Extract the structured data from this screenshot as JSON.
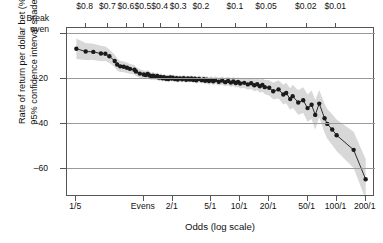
{
  "chart_data": {
    "type": "line",
    "title": "",
    "subtitle": "",
    "xlabel": "Odds (log scale)",
    "ylabel": "Rate of return per dollar bet (%)\n95% confidence interval shaded",
    "ylabel_line1": "Rate of return per dollar bet (%)",
    "ylabel_line2": "95% confidence interval shaded",
    "grid": true,
    "legend_position": "none",
    "annotations": [
      "Break even",
      "95% confidence interval shaded"
    ],
    "y_axis": {
      "ticks": [
        0,
        -20,
        -40,
        -60
      ],
      "tick_labels": [
        "Break even",
        "-20",
        "-40",
        "-60"
      ],
      "break_even_label_line1": "Break",
      "break_even_label_line2": "even",
      "ylim": [
        -72,
        2
      ],
      "unit": "%"
    },
    "x_axis_bottom": {
      "label": "Odds (log scale)",
      "scale": "log",
      "tick_labels": [
        "1/5",
        "Evens",
        "2/1",
        "5/1",
        "10/1",
        "20/1",
        "50/1",
        "100/1",
        "200/1"
      ],
      "tick_values": [
        0.2,
        1,
        2,
        5,
        10,
        20,
        50,
        100,
        200
      ],
      "xlim": [
        0.16,
        250
      ]
    },
    "x_axis_top": {
      "label": "",
      "tick_labels": [
        "$0.8",
        "$0.7",
        "$0.6",
        "$0.5",
        "$0.4",
        "$0.3",
        "$0.2",
        "$0.1",
        "$0.05",
        "$0.02",
        "$0.01"
      ],
      "tick_values": [
        0.8,
        0.7,
        0.6,
        0.5,
        0.4,
        0.3,
        0.2,
        0.1,
        0.05,
        0.02,
        0.01
      ],
      "description": "implied probability price per dollar"
    },
    "series": [
      {
        "name": "Rate of return per dollar bet",
        "marker": "filled-circle",
        "line_color": "#1a1a1a",
        "band_color": "#c9c9c9",
        "x": [
          0.2,
          0.25,
          0.3,
          0.36,
          0.4,
          0.44,
          0.5,
          0.53,
          0.57,
          0.62,
          0.67,
          0.72,
          0.8,
          0.83,
          0.91,
          1.0,
          1.05,
          1.1,
          1.15,
          1.2,
          1.25,
          1.3,
          1.38,
          1.44,
          1.5,
          1.57,
          1.62,
          1.7,
          1.75,
          1.8,
          1.88,
          1.95,
          2.0,
          2.1,
          2.2,
          2.25,
          2.38,
          2.5,
          2.6,
          2.75,
          2.87,
          3.0,
          3.13,
          3.25,
          3.4,
          3.5,
          3.75,
          4.0,
          4.2,
          4.33,
          4.5,
          4.75,
          5.0,
          5.25,
          5.5,
          6.0,
          6.5,
          7.0,
          7.5,
          8.0,
          8.5,
          9.0,
          9.5,
          10.0,
          11.0,
          12.0,
          13.0,
          14.0,
          15.0,
          16.0,
          17.0,
          18.0,
          20.0,
          22.0,
          25.0,
          28.0,
          30.0,
          33.0,
          35.0,
          40.0,
          45.0,
          50.0,
          55.0,
          60.0,
          66.0,
          75.0,
          80.0,
          90.0,
          100.0,
          150.0,
          200.0
        ],
        "y": [
          -7.2,
          -8.4,
          -8.6,
          -9.3,
          -9.4,
          -10.5,
          -12.6,
          -14.2,
          -15.0,
          -15.2,
          -15.6,
          -16.1,
          -16.5,
          -17.3,
          -18.2,
          -18.6,
          -18.8,
          -18.4,
          -19.0,
          -19.5,
          -19.1,
          -19.6,
          -19.3,
          -20.0,
          -19.7,
          -20.3,
          -19.8,
          -20.5,
          -20.1,
          -20.6,
          -19.9,
          -20.4,
          -20.0,
          -20.6,
          -20.2,
          -20.8,
          -20.3,
          -20.7,
          -20.2,
          -20.9,
          -20.4,
          -20.8,
          -20.3,
          -21.0,
          -20.5,
          -21.2,
          -20.6,
          -21.1,
          -20.7,
          -21.4,
          -20.9,
          -21.5,
          -21.0,
          -21.6,
          -21.1,
          -21.8,
          -21.3,
          -22.0,
          -21.5,
          -22.2,
          -21.7,
          -22.4,
          -21.9,
          -22.6,
          -22.3,
          -23.0,
          -22.5,
          -23.4,
          -22.9,
          -23.8,
          -23.2,
          -24.2,
          -24.5,
          -26.0,
          -25.2,
          -27.5,
          -26.8,
          -29.5,
          -28.2,
          -31.0,
          -30.0,
          -33.5,
          -32.0,
          -36.5,
          -31.5,
          -38.0,
          -40.5,
          -43.0,
          -45.5,
          -52.0,
          -65.0
        ],
        "ci_half_width": [
          4.5,
          3.8,
          3.6,
          3.4,
          3.2,
          3.0,
          2.8,
          2.6,
          2.5,
          2.4,
          2.3,
          2.2,
          2.1,
          2.0,
          1.9,
          1.8,
          1.8,
          1.8,
          1.7,
          1.7,
          1.7,
          1.6,
          1.6,
          1.6,
          1.6,
          1.5,
          1.5,
          1.5,
          1.5,
          1.5,
          1.5,
          1.5,
          1.4,
          1.4,
          1.4,
          1.4,
          1.4,
          1.4,
          1.4,
          1.4,
          1.4,
          1.4,
          1.4,
          1.4,
          1.5,
          1.5,
          1.5,
          1.5,
          1.5,
          1.6,
          1.6,
          1.6,
          1.6,
          1.7,
          1.7,
          1.7,
          1.8,
          1.8,
          1.9,
          1.9,
          2.0,
          2.0,
          2.1,
          2.2,
          2.3,
          2.4,
          2.5,
          2.6,
          2.7,
          2.9,
          3.0,
          3.2,
          3.4,
          3.7,
          4.0,
          4.3,
          4.5,
          4.8,
          5.0,
          5.4,
          5.7,
          6.0,
          6.3,
          6.6,
          6.0,
          6.4,
          6.6,
          6.8,
          7.0,
          8.0,
          9.0
        ]
      }
    ]
  }
}
